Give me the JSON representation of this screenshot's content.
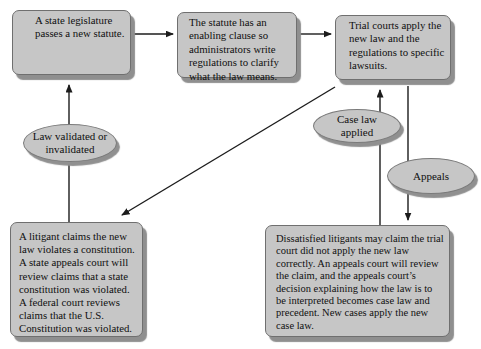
{
  "diagram": {
    "colors": {
      "node_fill": "#c6c6c6",
      "node_border": "#6f6f6f",
      "node_shadow": "#8f8f8f",
      "arrow": "#1c1c1c",
      "text": "#101010",
      "background": "#ffffff"
    },
    "boxes": [
      {
        "id": "legislature",
        "text": "A state legislature passes a new statute."
      },
      {
        "id": "enabling-clause",
        "text": "The statute has an enabling clause so administrators write regulations to clarify what the law means."
      },
      {
        "id": "trial-courts",
        "text": "Trial courts apply the new law and the regulations to specific lawsuits."
      },
      {
        "id": "litigant-constitution",
        "text": "A litigant claims the new law violates a constitution. A state appeals court will review claims that a state constitution was violated. A federal court reviews claims that the U.S. Constitution was violated."
      },
      {
        "id": "dissatisfied-litigants",
        "text": "Dissatisfied litigants may claim the trial court did not apply the new law correctly. An appeals court will review the claim, and the appeals court’s decision explaining how the law is to be interpreted becomes case law and precedent. New cases apply the new case law."
      }
    ],
    "ellipses": [
      {
        "id": "law-validated",
        "text": "Law validated or invalidated"
      },
      {
        "id": "case-law-applied",
        "text": "Case law applied"
      },
      {
        "id": "appeals",
        "text": "Appeals"
      }
    ],
    "arrows": [
      {
        "from": "legislature",
        "to": "enabling-clause"
      },
      {
        "from": "enabling-clause",
        "to": "trial-courts"
      },
      {
        "from": "litigant-constitution",
        "to": "legislature",
        "via": "law-validated"
      },
      {
        "from": "trial-courts",
        "to": "litigant-constitution"
      },
      {
        "from": "dissatisfied-litigants",
        "to": "trial-courts",
        "via": "case-law-applied"
      },
      {
        "from": "trial-courts",
        "to": "dissatisfied-litigants",
        "via": "appeals"
      }
    ]
  }
}
